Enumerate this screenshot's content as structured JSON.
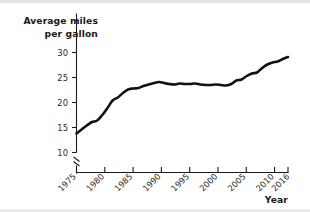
{
  "chart_data": {
    "type": "line",
    "title": "",
    "xlabel": "Year",
    "ylabel": "Average miles per gallon",
    "ylabel_line1": "Average miles",
    "ylabel_line2": "per gallon",
    "xlim": [
      1975,
      2016
    ],
    "ylim": [
      10,
      32
    ],
    "y_axis_break": true,
    "y_axis_break_symbol": "//",
    "grid": false,
    "legend": null,
    "line_color": "#111111",
    "background_color": "#ffffff",
    "yticks": [
      "10",
      "15",
      "20",
      "25",
      "30"
    ],
    "ytick_values": [
      10,
      15,
      20,
      25,
      30
    ],
    "xticks": [
      "1975",
      "1980",
      "1985",
      "1990",
      "1995",
      "2000",
      "2005",
      "2010",
      "2016"
    ],
    "xtick_values": [
      1975,
      1980,
      1985,
      1990,
      1995,
      2000,
      2005,
      2010,
      2016
    ],
    "x": [
      1975,
      1976,
      1977,
      1978,
      1979,
      1980,
      1981,
      1982,
      1983,
      1984,
      1985,
      1986,
      1987,
      1988,
      1989,
      1990,
      1991,
      1992,
      1993,
      1994,
      1995,
      1996,
      1997,
      1998,
      1999,
      2000,
      2001,
      2002,
      2003,
      2004,
      2005,
      2006,
      2007,
      2008,
      2009,
      2010,
      2011,
      2012,
      2013,
      2014,
      2015,
      2016
    ],
    "values": [
      13.8,
      14.6,
      15.4,
      16.1,
      16.4,
      17.5,
      18.9,
      20.4,
      21.0,
      21.9,
      22.6,
      22.8,
      22.9,
      23.3,
      23.6,
      23.9,
      24.1,
      23.9,
      23.7,
      23.6,
      23.8,
      23.7,
      23.7,
      23.8,
      23.6,
      23.5,
      23.5,
      23.6,
      23.5,
      23.4,
      23.7,
      24.4,
      24.6,
      25.3,
      25.8,
      26.0,
      26.9,
      27.6,
      28.0,
      28.2,
      28.7,
      29.1
    ]
  },
  "axis": {
    "xlabel_text": "Year"
  }
}
